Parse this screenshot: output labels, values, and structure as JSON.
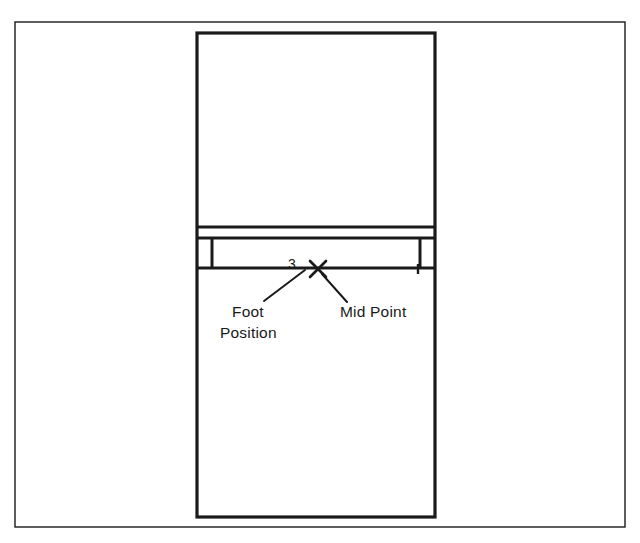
{
  "figure": {
    "kind": "line-drawing",
    "background_color": "#ffffff",
    "stroke_color": "#1a1a1a"
  },
  "outer_frame": {
    "name": "outer-border",
    "x": 15,
    "y": 22,
    "width": 610,
    "height": 505,
    "stroke_width": 1.4
  },
  "inner_rectangle": {
    "name": "main-body-outline",
    "x": 197,
    "y": 33,
    "width": 238,
    "height": 484,
    "stroke_width": 3.2
  },
  "band": {
    "name": "horizontal-band",
    "top_y": 238,
    "bottom_y": 268,
    "left_x": 197,
    "right_x": 435,
    "upper_divider_y": 227,
    "stroke_width": 3.2,
    "left_divider_x": 212,
    "right_divider_x": 420,
    "divider_stroke_width": 3.0
  },
  "markers": {
    "mid_point_x": 318,
    "mid_point_y": 269,
    "mid_point_glyph": "x-cross-mark",
    "right_tick_x": 418,
    "right_tick_y": 269
  },
  "leaders": [
    {
      "name": "foot-position-leader",
      "x1": 305,
      "y1": 270,
      "x2": 264,
      "y2": 301
    },
    {
      "name": "mid-point-leader",
      "x1": 322,
      "y1": 274,
      "x2": 347,
      "y2": 302
    }
  ],
  "labels": {
    "dimension": {
      "text": "3",
      "x": 292,
      "y": 269,
      "anchor": "middle"
    },
    "foot_position": {
      "line1": "Foot",
      "line2": "Position",
      "line1_x": 232,
      "line1_y": 317,
      "line2_x": 220,
      "line2_y": 338,
      "anchor": "start"
    },
    "mid_point": {
      "text": "Mid Point",
      "x": 340,
      "y": 317,
      "anchor": "start"
    }
  }
}
